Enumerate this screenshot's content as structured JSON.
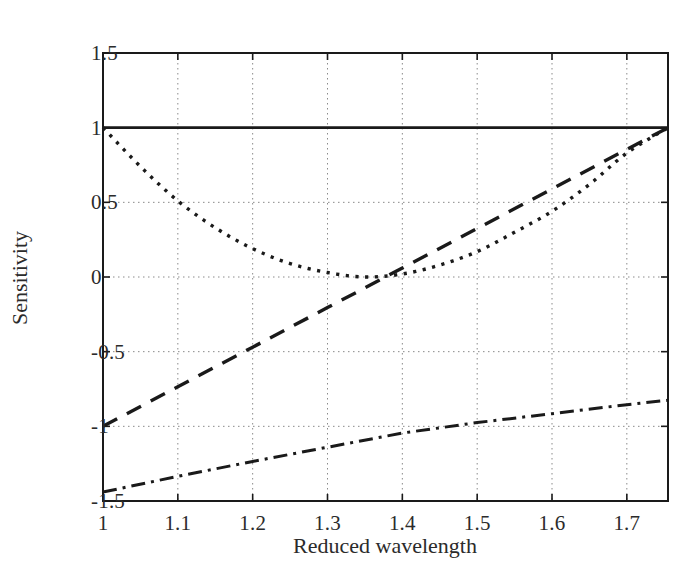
{
  "chart_data": {
    "type": "line",
    "title": "",
    "xlabel": "Reduced wavelength",
    "ylabel": "Sensitivity",
    "xlim": [
      1.0,
      1.755
    ],
    "ylim": [
      -1.5,
      1.5
    ],
    "xticks": [
      "1",
      "1.1",
      "1.2",
      "1.3",
      "1.4",
      "1.5",
      "1.6",
      "1.7"
    ],
    "xtick_values": [
      1.0,
      1.1,
      1.2,
      1.3,
      1.4,
      1.5,
      1.6,
      1.7
    ],
    "yticks": [
      "1.5",
      "1",
      "0.5",
      "0",
      "-0.5",
      "-1",
      "-1.5"
    ],
    "ytick_values": [
      1.5,
      1.0,
      0.5,
      0.0,
      -0.5,
      -1.0,
      -1.5
    ],
    "grid": true,
    "grid_style": "dotted",
    "legend_position": "none",
    "line_color": "#1a1a1a",
    "series": [
      {
        "name": "solid",
        "style": "solid",
        "x": [
          1.0,
          1.1,
          1.2,
          1.3,
          1.4,
          1.5,
          1.6,
          1.7,
          1.755
        ],
        "values": [
          1.0,
          1.0,
          1.0,
          1.0,
          1.0,
          1.0,
          1.0,
          1.0,
          1.0
        ]
      },
      {
        "name": "dashed",
        "style": "dashed",
        "x": [
          1.0,
          1.1,
          1.2,
          1.3,
          1.4,
          1.5,
          1.6,
          1.7,
          1.755
        ],
        "values": [
          -1.0,
          -0.735,
          -0.47,
          -0.205,
          0.06,
          0.325,
          0.59,
          0.855,
          1.0
        ]
      },
      {
        "name": "dotted",
        "style": "dotted",
        "x": [
          1.0,
          1.05,
          1.1,
          1.15,
          1.2,
          1.25,
          1.3,
          1.35,
          1.4,
          1.45,
          1.5,
          1.55,
          1.6,
          1.65,
          1.7,
          1.755
        ],
        "values": [
          1.0,
          0.74,
          0.51,
          0.33,
          0.19,
          0.09,
          0.03,
          0.0,
          0.02,
          0.08,
          0.17,
          0.3,
          0.44,
          0.62,
          0.83,
          1.0
        ]
      },
      {
        "name": "dash-dot",
        "style": "dashdot",
        "x": [
          1.0,
          1.1,
          1.2,
          1.3,
          1.4,
          1.5,
          1.6,
          1.7,
          1.755
        ],
        "values": [
          -1.44,
          -1.335,
          -1.235,
          -1.14,
          -1.045,
          -0.975,
          -0.915,
          -0.855,
          -0.825
        ]
      }
    ]
  },
  "axes": {
    "xlabel": "Reduced wavelength",
    "ylabel": "Sensitivity"
  }
}
